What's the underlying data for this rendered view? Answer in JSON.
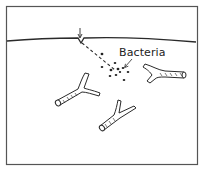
{
  "diagram": {
    "type": "illustration",
    "labels": {
      "bacteria": "Bacteria"
    },
    "colors": {
      "stroke": "#2a2a2a",
      "background": "#ffffff",
      "frame": "#555555"
    },
    "elements": [
      {
        "name": "frame",
        "kind": "border"
      },
      {
        "name": "surface-line",
        "kind": "line"
      },
      {
        "name": "entry-arrow",
        "kind": "arrow"
      },
      {
        "name": "puncture-path",
        "kind": "dashed-line"
      },
      {
        "name": "bacteria-cluster",
        "kind": "dots",
        "count": 11
      },
      {
        "name": "bacteria-label-arrow",
        "kind": "arrow"
      },
      {
        "name": "tube-left",
        "kind": "branching-tube"
      },
      {
        "name": "tube-center",
        "kind": "branching-tube"
      },
      {
        "name": "tube-right",
        "kind": "branching-tube"
      }
    ]
  }
}
